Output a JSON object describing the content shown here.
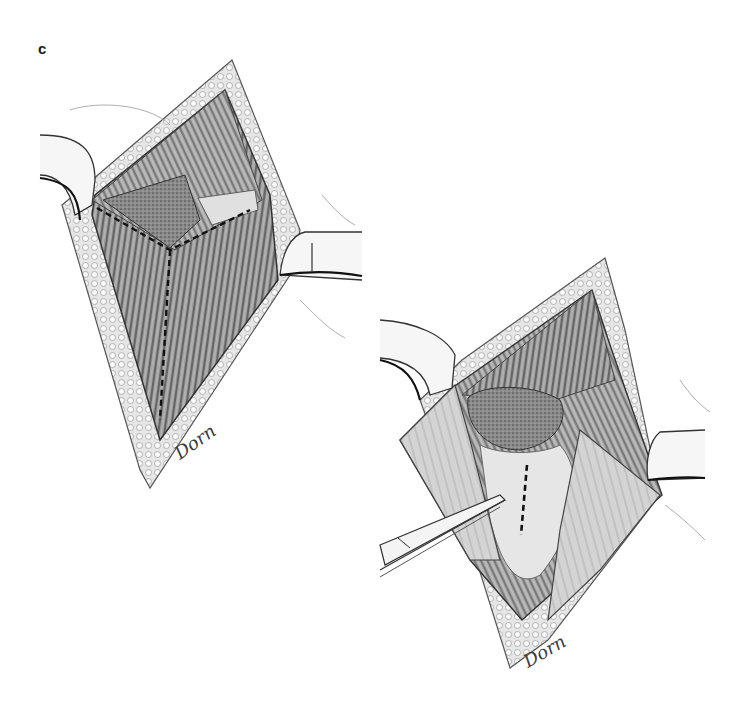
{
  "figure": {
    "panel_label": "c",
    "style": "grayscale pencil surgical illustration",
    "colors": {
      "ink": "#1a1a1a",
      "shade_dark": "#5a5a5a",
      "shade_mid": "#8c8c8c",
      "shade_light": "#c8c8c8",
      "skin": "#f2f2f2",
      "background": "#ffffff"
    },
    "illustrations": [
      {
        "id": "upper-left",
        "description": "diamond-shaped surgical exposure with retractors, Y-shaped dashed incision line over fascia",
        "signature": "Dorn"
      },
      {
        "id": "lower-right",
        "description": "deeper exposure with forceps retracting tissue, vertical dashed incision line",
        "signature": "Dorn"
      }
    ]
  }
}
